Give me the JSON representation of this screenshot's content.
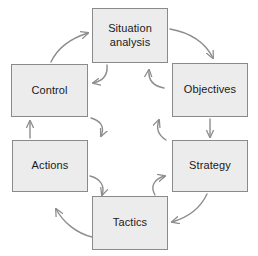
{
  "diagram": {
    "type": "cycle-diagram",
    "colors": {
      "box_fill": "#ececec",
      "box_border": "#8a8a8a",
      "arrow": "#8d8d8d",
      "text": "#1a1a1a",
      "background": "#ffffff"
    },
    "nodes": [
      {
        "id": "situation",
        "label": "Situation\nanalysis",
        "position": "top"
      },
      {
        "id": "objectives",
        "label": "Objectives",
        "position": "upper-right"
      },
      {
        "id": "strategy",
        "label": "Strategy",
        "position": "lower-right"
      },
      {
        "id": "tactics",
        "label": "Tactics",
        "position": "bottom"
      },
      {
        "id": "actions",
        "label": "Actions",
        "position": "lower-left"
      },
      {
        "id": "control",
        "label": "Control",
        "position": "upper-left"
      }
    ],
    "edges": [
      {
        "id": "edge-situation-objectives",
        "from": "situation",
        "to": "objectives",
        "style": "curved",
        "direction": "clockwise"
      },
      {
        "id": "edge-objectives-strategy",
        "from": "objectives",
        "to": "strategy",
        "style": "straight",
        "direction": "clockwise"
      },
      {
        "id": "edge-strategy-tactics",
        "from": "strategy",
        "to": "tactics",
        "style": "curved",
        "direction": "clockwise"
      },
      {
        "id": "edge-tactics-actions",
        "from": "tactics",
        "to": "actions",
        "style": "curved",
        "direction": "clockwise"
      },
      {
        "id": "edge-actions-control",
        "from": "actions",
        "to": "control",
        "style": "straight",
        "direction": "clockwise"
      },
      {
        "id": "edge-control-situation",
        "from": "control",
        "to": "situation",
        "style": "curved",
        "direction": "clockwise"
      },
      {
        "id": "edge-situation-control",
        "from": "situation",
        "to": "control",
        "style": "curved-inner",
        "direction": "counter-clockwise"
      },
      {
        "id": "edge-objectives-situation",
        "from": "objectives",
        "to": "situation",
        "style": "curved-inner",
        "direction": "counter-clockwise"
      },
      {
        "id": "edge-strategy-objectives",
        "from": "strategy",
        "to": "objectives",
        "style": "curved-inner",
        "direction": "counter-clockwise"
      },
      {
        "id": "edge-tactics-strategy",
        "from": "tactics",
        "to": "strategy",
        "style": "curved-inner",
        "direction": "counter-clockwise"
      },
      {
        "id": "edge-actions-tactics",
        "from": "actions",
        "to": "tactics",
        "style": "curved-inner",
        "direction": "counter-clockwise"
      },
      {
        "id": "edge-control-actions",
        "from": "control",
        "to": "actions",
        "style": "curved-inner",
        "direction": "counter-clockwise"
      }
    ]
  }
}
